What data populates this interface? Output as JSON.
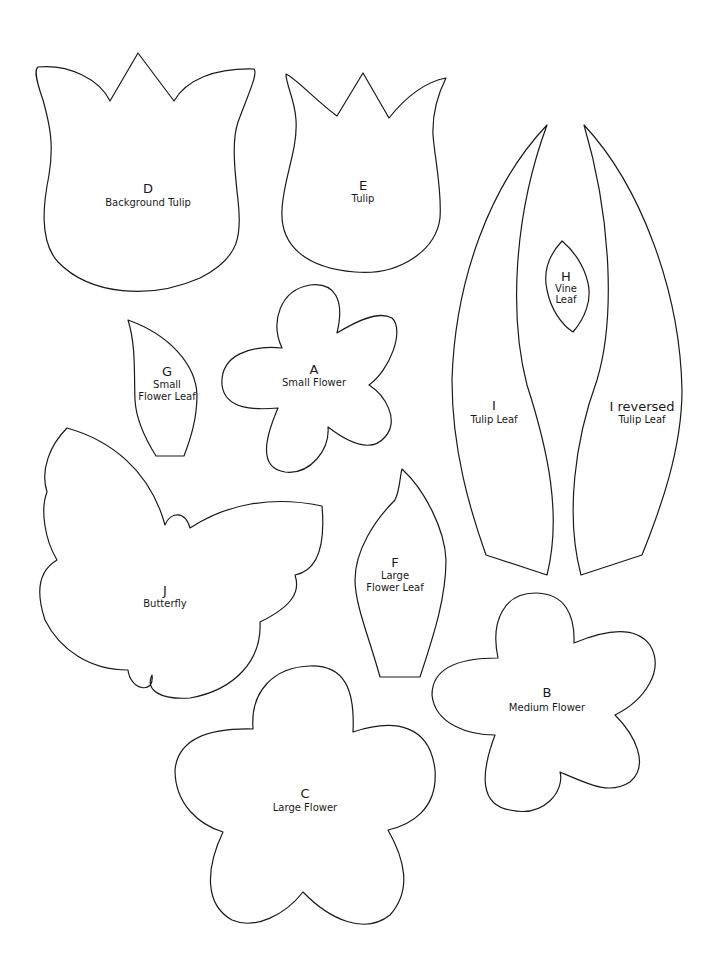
{
  "page": {
    "background": "#ffffff",
    "stroke_color": "#1a1a1a"
  },
  "templates": [
    {
      "id": "D",
      "letter": "D",
      "name": "Background Tulip"
    },
    {
      "id": "E",
      "letter": "E",
      "name": "Tulip"
    },
    {
      "id": "H",
      "letter": "H",
      "name_line1": "Vine",
      "name_line2": "Leaf"
    },
    {
      "id": "G",
      "letter": "G",
      "name_line1": "Small",
      "name_line2": "Flower Leaf"
    },
    {
      "id": "A",
      "letter": "A",
      "name": "Small Flower"
    },
    {
      "id": "I",
      "letter": "I",
      "name": "Tulip Leaf"
    },
    {
      "id": "I-reversed",
      "letter": "I reversed",
      "name": "Tulip Leaf"
    },
    {
      "id": "J",
      "letter": "J",
      "name": "Butterfly"
    },
    {
      "id": "F",
      "letter": "F",
      "name_line1": "Large",
      "name_line2": "Flower Leaf"
    },
    {
      "id": "B",
      "letter": "B",
      "name": "Medium Flower"
    },
    {
      "id": "C",
      "letter": "C",
      "name": "Large Flower"
    }
  ]
}
